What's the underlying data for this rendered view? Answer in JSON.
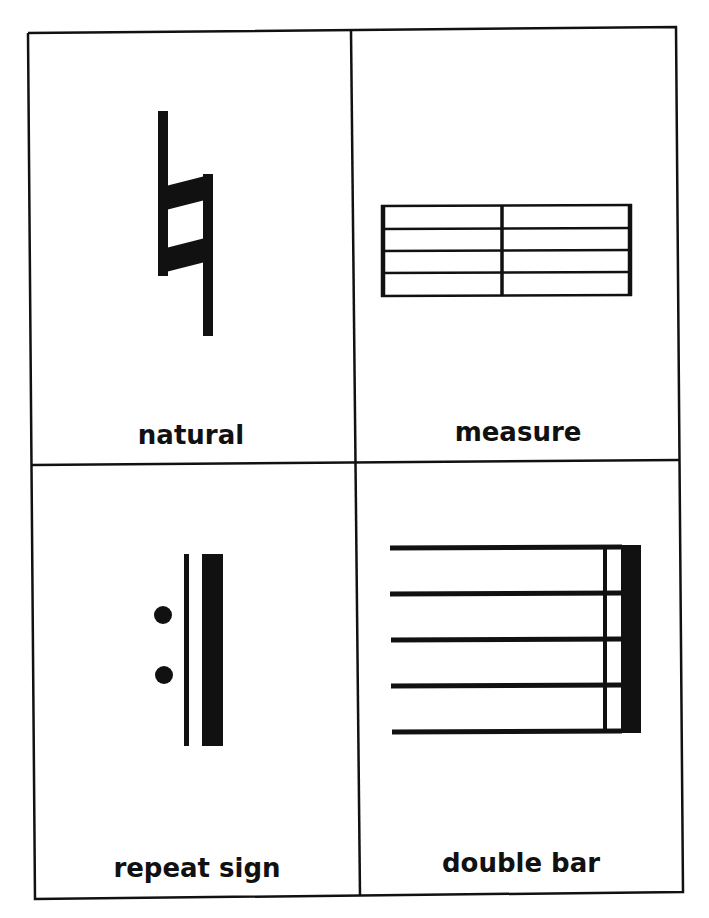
{
  "worksheet": {
    "cards": [
      {
        "label": "natural",
        "symbol": "natural-sign-icon"
      },
      {
        "label": "measure",
        "symbol": "measure-staff-icon"
      },
      {
        "label": "repeat sign",
        "symbol": "repeat-sign-icon"
      },
      {
        "label": "double bar",
        "symbol": "double-bar-icon"
      }
    ]
  },
  "colors": {
    "ink": "#111111",
    "paper": "#ffffff"
  }
}
